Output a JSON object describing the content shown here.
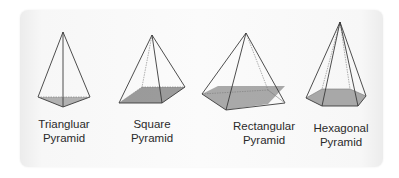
{
  "colors": {
    "edge": "#3a3a3a",
    "base_fill": "#9a9a9a",
    "card_bg": "#f8f8f8",
    "text": "#2a2a2a"
  },
  "pyramids": [
    {
      "line1": "Triangluar",
      "line2": "Pyramid"
    },
    {
      "line1": "Square",
      "line2": "Pyramid"
    },
    {
      "line1": "Rectangular",
      "line2": "Pyramid"
    },
    {
      "line1": "Hexagonal",
      "line2": "Pyramid"
    }
  ]
}
